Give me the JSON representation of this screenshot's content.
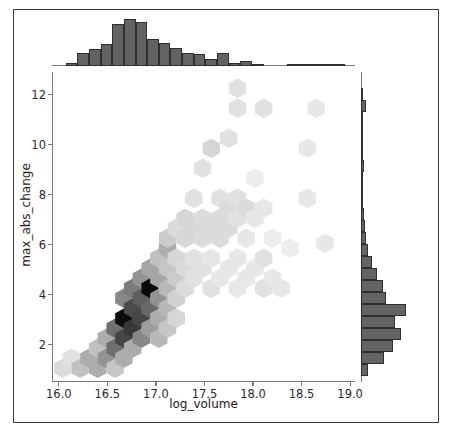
{
  "chart_data": {
    "type": "scatter",
    "plot_kind": "hexbin-jointplot",
    "title": "",
    "xlabel": "log_volume",
    "ylabel": "max_abs_change",
    "xlim": [
      15.93,
      19.05
    ],
    "ylim": [
      0.5,
      12.9
    ],
    "xticks": [
      "16.0",
      "16.5",
      "17.0",
      "17.5",
      "18.0",
      "18.5",
      "19.0"
    ],
    "xtick_values": [
      16.0,
      16.5,
      17.0,
      17.5,
      18.0,
      18.5,
      19.0
    ],
    "yticks": [
      "2",
      "4",
      "6",
      "8",
      "10",
      "12"
    ],
    "ytick_values": [
      2,
      4,
      6,
      8,
      10,
      12
    ],
    "grid": false,
    "legend": null,
    "colormap": "Greys",
    "hex_gridsize": 18,
    "hexbins": [
      {
        "x": 16.04,
        "y": 1.05,
        "c": 0.12
      },
      {
        "x": 16.13,
        "y": 1.45,
        "c": 0.1
      },
      {
        "x": 16.22,
        "y": 1.05,
        "c": 0.22
      },
      {
        "x": 16.31,
        "y": 1.45,
        "c": 0.3
      },
      {
        "x": 16.4,
        "y": 1.05,
        "c": 0.3
      },
      {
        "x": 16.4,
        "y": 1.85,
        "c": 0.22
      },
      {
        "x": 16.49,
        "y": 1.45,
        "c": 0.4
      },
      {
        "x": 16.49,
        "y": 2.25,
        "c": 0.3
      },
      {
        "x": 16.58,
        "y": 1.85,
        "c": 0.55
      },
      {
        "x": 16.58,
        "y": 1.05,
        "c": 0.2
      },
      {
        "x": 16.58,
        "y": 2.65,
        "c": 0.55
      },
      {
        "x": 16.67,
        "y": 1.45,
        "c": 0.3
      },
      {
        "x": 16.67,
        "y": 2.25,
        "c": 0.72
      },
      {
        "x": 16.67,
        "y": 3.05,
        "c": 0.97
      },
      {
        "x": 16.67,
        "y": 3.85,
        "c": 0.45
      },
      {
        "x": 16.76,
        "y": 1.85,
        "c": 0.3
      },
      {
        "x": 16.76,
        "y": 2.65,
        "c": 0.78
      },
      {
        "x": 16.76,
        "y": 3.45,
        "c": 0.7
      },
      {
        "x": 16.76,
        "y": 4.25,
        "c": 0.5
      },
      {
        "x": 16.85,
        "y": 2.25,
        "c": 0.45
      },
      {
        "x": 16.85,
        "y": 3.05,
        "c": 0.72
      },
      {
        "x": 16.85,
        "y": 3.85,
        "c": 0.62
      },
      {
        "x": 16.85,
        "y": 4.65,
        "c": 0.4
      },
      {
        "x": 16.94,
        "y": 2.65,
        "c": 0.36
      },
      {
        "x": 16.94,
        "y": 3.45,
        "c": 0.58
      },
      {
        "x": 16.94,
        "y": 4.25,
        "c": 0.98
      },
      {
        "x": 16.94,
        "y": 5.05,
        "c": 0.33
      },
      {
        "x": 17.03,
        "y": 3.05,
        "c": 0.3
      },
      {
        "x": 17.03,
        "y": 3.85,
        "c": 0.4
      },
      {
        "x": 17.03,
        "y": 4.65,
        "c": 0.33
      },
      {
        "x": 17.03,
        "y": 5.45,
        "c": 0.22
      },
      {
        "x": 17.03,
        "y": 2.25,
        "c": 0.26
      },
      {
        "x": 17.12,
        "y": 2.65,
        "c": 0.2
      },
      {
        "x": 17.12,
        "y": 3.45,
        "c": 0.26
      },
      {
        "x": 17.12,
        "y": 4.25,
        "c": 0.26
      },
      {
        "x": 17.12,
        "y": 5.05,
        "c": 0.2
      },
      {
        "x": 17.12,
        "y": 5.85,
        "c": 0.3
      },
      {
        "x": 17.12,
        "y": 6.25,
        "c": 0.18
      },
      {
        "x": 17.21,
        "y": 3.05,
        "c": 0.14
      },
      {
        "x": 17.21,
        "y": 3.85,
        "c": 0.16
      },
      {
        "x": 17.21,
        "y": 4.65,
        "c": 0.18
      },
      {
        "x": 17.21,
        "y": 5.45,
        "c": 0.14
      },
      {
        "x": 17.21,
        "y": 6.65,
        "c": 0.12
      },
      {
        "x": 17.3,
        "y": 4.25,
        "c": 0.12
      },
      {
        "x": 17.3,
        "y": 5.05,
        "c": 0.12
      },
      {
        "x": 17.3,
        "y": 6.25,
        "c": 0.14
      },
      {
        "x": 17.3,
        "y": 7.05,
        "c": 0.14
      },
      {
        "x": 17.39,
        "y": 4.65,
        "c": 0.1
      },
      {
        "x": 17.39,
        "y": 5.45,
        "c": 0.1
      },
      {
        "x": 17.39,
        "y": 6.65,
        "c": 0.14
      },
      {
        "x": 17.39,
        "y": 7.85,
        "c": 0.1
      },
      {
        "x": 17.48,
        "y": 5.05,
        "c": 0.1
      },
      {
        "x": 17.48,
        "y": 6.25,
        "c": 0.12
      },
      {
        "x": 17.48,
        "y": 7.05,
        "c": 0.12
      },
      {
        "x": 17.48,
        "y": 9.05,
        "c": 0.1
      },
      {
        "x": 17.57,
        "y": 4.25,
        "c": 0.1
      },
      {
        "x": 17.57,
        "y": 5.45,
        "c": 0.08
      },
      {
        "x": 17.57,
        "y": 6.65,
        "c": 0.12
      },
      {
        "x": 17.57,
        "y": 9.85,
        "c": 0.14
      },
      {
        "x": 17.66,
        "y": 4.65,
        "c": 0.08
      },
      {
        "x": 17.66,
        "y": 6.25,
        "c": 0.12
      },
      {
        "x": 17.66,
        "y": 7.05,
        "c": 0.12
      },
      {
        "x": 17.66,
        "y": 7.85,
        "c": 0.1
      },
      {
        "x": 17.75,
        "y": 5.05,
        "c": 0.08
      },
      {
        "x": 17.75,
        "y": 6.65,
        "c": 0.12
      },
      {
        "x": 17.75,
        "y": 7.45,
        "c": 0.12
      },
      {
        "x": 17.75,
        "y": 10.25,
        "c": 0.1
      },
      {
        "x": 17.84,
        "y": 4.25,
        "c": 0.08
      },
      {
        "x": 17.84,
        "y": 5.45,
        "c": 0.08
      },
      {
        "x": 17.84,
        "y": 7.05,
        "c": 0.1
      },
      {
        "x": 17.84,
        "y": 7.85,
        "c": 0.1
      },
      {
        "x": 17.84,
        "y": 11.45,
        "c": 0.1
      },
      {
        "x": 17.84,
        "y": 12.25,
        "c": 0.1
      },
      {
        "x": 17.93,
        "y": 4.65,
        "c": 0.08
      },
      {
        "x": 17.93,
        "y": 6.25,
        "c": 0.08
      },
      {
        "x": 17.93,
        "y": 7.45,
        "c": 0.12
      },
      {
        "x": 18.02,
        "y": 5.05,
        "c": 0.08
      },
      {
        "x": 18.02,
        "y": 7.05,
        "c": 0.08
      },
      {
        "x": 18.02,
        "y": 8.65,
        "c": 0.06
      },
      {
        "x": 18.11,
        "y": 4.25,
        "c": 0.1
      },
      {
        "x": 18.11,
        "y": 5.45,
        "c": 0.1
      },
      {
        "x": 18.11,
        "y": 7.45,
        "c": 0.08
      },
      {
        "x": 18.11,
        "y": 11.45,
        "c": 0.1
      },
      {
        "x": 18.2,
        "y": 4.65,
        "c": 0.08
      },
      {
        "x": 18.2,
        "y": 6.25,
        "c": 0.06
      },
      {
        "x": 18.29,
        "y": 4.25,
        "c": 0.08
      },
      {
        "x": 18.38,
        "y": 5.85,
        "c": 0.06
      },
      {
        "x": 18.56,
        "y": 7.85,
        "c": 0.08
      },
      {
        "x": 18.56,
        "y": 9.85,
        "c": 0.08
      },
      {
        "x": 18.65,
        "y": 11.45,
        "c": 0.08
      },
      {
        "x": 18.74,
        "y": 6.05,
        "c": 0.08
      }
    ],
    "marginal_x": {
      "type": "bar",
      "orientation": "vertical",
      "bin_edges": [
        15.95,
        16.07,
        16.19,
        16.31,
        16.43,
        16.55,
        16.67,
        16.79,
        16.91,
        17.03,
        17.15,
        17.27,
        17.39,
        17.51,
        17.63,
        17.75,
        17.87,
        17.99,
        18.11,
        18.23,
        18.35,
        18.47,
        18.59,
        18.71,
        18.83,
        18.95,
        19.07
      ],
      "counts": [
        0,
        2,
        8,
        10,
        13,
        25,
        28,
        26,
        16,
        14,
        11,
        8,
        7,
        4,
        8,
        2,
        3,
        1,
        0,
        0,
        0.6,
        1,
        0.6,
        0.4,
        0.3,
        0
      ]
    },
    "marginal_y": {
      "type": "bar",
      "orientation": "horizontal",
      "bin_edges": [
        0.75,
        1.23,
        1.71,
        2.19,
        2.67,
        3.15,
        3.63,
        4.11,
        4.59,
        5.07,
        5.55,
        6.03,
        6.51,
        6.99,
        7.47,
        7.95,
        8.43,
        8.91,
        9.39,
        9.87,
        10.35,
        10.83,
        11.31,
        11.79,
        12.27
      ],
      "counts": [
        4,
        13,
        18,
        22,
        19,
        25,
        14,
        12,
        9,
        6,
        4,
        3,
        2,
        1.5,
        1,
        1,
        1,
        1.5,
        0.6,
        0.6,
        0.4,
        0.4,
        2.5,
        1
      ]
    }
  },
  "style": {
    "hist_fill": "#636363",
    "hist_edge": "#2f2f2f",
    "spine_color": "#7a7a7a",
    "frame_color": "#3a3a3a",
    "text_color": "#1c1c1c",
    "background": "#ffffff"
  }
}
